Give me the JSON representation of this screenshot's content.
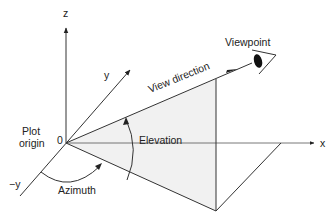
{
  "diagram": {
    "type": "3d-view-geometry",
    "colors": {
      "line": "#333333",
      "shade": "#f1f1f1",
      "background": "#ffffff"
    },
    "axes": {
      "z": "z",
      "y": "y",
      "neg_y": "−y",
      "x": "x",
      "origin": "0"
    },
    "labels": {
      "plot_origin_line1": "Plot",
      "plot_origin_line2": "origin",
      "view_direction": "View direction",
      "viewpoint": "Viewpoint",
      "elevation": "Elevation",
      "azimuth": "Azimuth"
    },
    "icons": {
      "viewpoint": "eye-icon"
    }
  }
}
